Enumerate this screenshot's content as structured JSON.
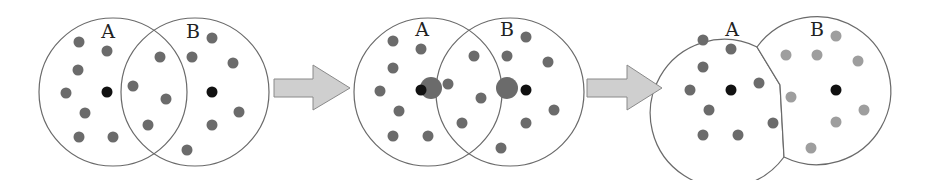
{
  "colors": {
    "outline": "#6a6a6a",
    "dot_gray": "#6b6b6b",
    "dot_light": "#9e9e9e",
    "dot_black": "#111111",
    "arrow_fill": "#cfcfcf",
    "arrow_stroke": "#8a8a8a"
  },
  "panels": [
    {
      "name": "initial-overlap",
      "labels": [
        {
          "text": "A",
          "x": 108,
          "y": 38
        },
        {
          "text": "B",
          "x": 193,
          "y": 38
        }
      ],
      "circles": [
        {
          "cx": 113,
          "cy": 92,
          "r": 74
        },
        {
          "cx": 195,
          "cy": 92,
          "r": 74
        }
      ],
      "centroids": [
        {
          "x": 107,
          "y": 92
        },
        {
          "x": 212,
          "y": 92
        }
      ],
      "dots": [
        [
          79,
          42
        ],
        [
          107,
          51
        ],
        [
          78,
          70
        ],
        [
          66,
          93
        ],
        [
          85,
          113
        ],
        [
          79,
          137
        ],
        [
          113,
          137
        ],
        [
          160,
          57
        ],
        [
          133,
          86
        ],
        [
          166,
          99
        ],
        [
          148,
          125
        ],
        [
          212,
          38
        ],
        [
          192,
          57
        ],
        [
          233,
          63
        ],
        [
          239,
          112
        ],
        [
          212,
          125
        ],
        [
          187,
          150
        ]
      ]
    },
    {
      "name": "centroid-shift",
      "labels": [
        {
          "text": "A",
          "x": 422,
          "y": 36
        },
        {
          "text": "B",
          "x": 507,
          "y": 36
        }
      ],
      "circles": [
        {
          "cx": 428,
          "cy": 92,
          "r": 74
        },
        {
          "cx": 510,
          "cy": 92,
          "r": 74
        }
      ],
      "centroids": [
        {
          "x": 421,
          "y": 90
        },
        {
          "x": 526,
          "y": 90
        }
      ],
      "new_centroids": [
        {
          "x": 431,
          "y": 88,
          "r": 11
        },
        {
          "x": 507,
          "y": 88,
          "r": 11
        }
      ],
      "dots": [
        [
          393,
          41
        ],
        [
          421,
          49
        ],
        [
          393,
          68
        ],
        [
          380,
          91
        ],
        [
          448,
          84
        ],
        [
          399,
          111
        ],
        [
          393,
          136
        ],
        [
          428,
          136
        ],
        [
          474,
          56
        ],
        [
          481,
          98
        ],
        [
          462,
          123
        ],
        [
          526,
          37
        ],
        [
          507,
          56
        ],
        [
          548,
          62
        ],
        [
          554,
          110
        ],
        [
          526,
          123
        ],
        [
          501,
          148
        ]
      ]
    },
    {
      "name": "reassigned-clusters",
      "labels": [
        {
          "text": "A",
          "x": 732,
          "y": 36
        },
        {
          "text": "B",
          "x": 817,
          "y": 36
        }
      ],
      "centroids": [
        {
          "x": 731,
          "y": 90
        },
        {
          "x": 836,
          "y": 90
        }
      ],
      "dots_a": [
        [
          703,
          40
        ],
        [
          731,
          49
        ],
        [
          703,
          67
        ],
        [
          690,
          90
        ],
        [
          759,
          83
        ],
        [
          709,
          110
        ],
        [
          703,
          135
        ],
        [
          738,
          135
        ],
        [
          773,
          123
        ]
      ],
      "dots_b": [
        [
          786,
          55
        ],
        [
          817,
          55
        ],
        [
          836,
          36
        ],
        [
          858,
          61
        ],
        [
          791,
          97
        ],
        [
          864,
          110
        ],
        [
          836,
          122
        ],
        [
          811,
          148
        ]
      ]
    }
  ],
  "arrows": [
    {
      "name": "arrow-step-1",
      "x0": 274,
      "head_x": 313,
      "tip_x": 350,
      "cy": 88
    },
    {
      "name": "arrow-step-2",
      "x0": 587,
      "head_x": 627,
      "tip_x": 662,
      "cy": 88
    }
  ]
}
